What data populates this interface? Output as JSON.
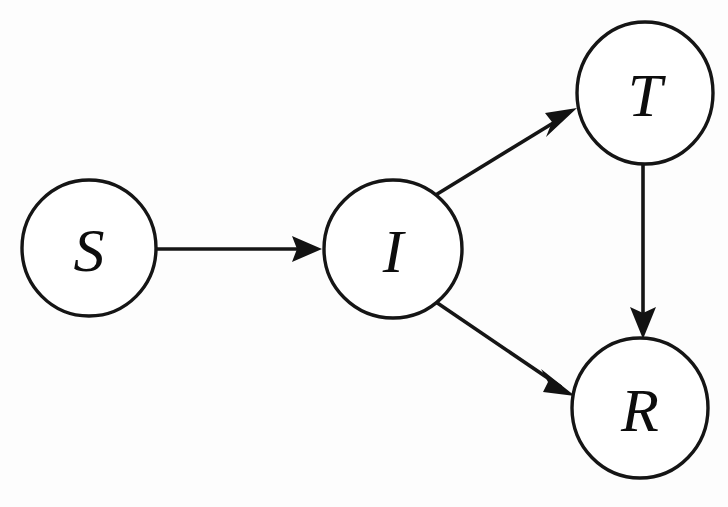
{
  "figure": {
    "type": "directed-graph",
    "background_color": "#fdfdfd",
    "stroke_color": "#151515",
    "label_color": "#0d0d0d",
    "width": 728,
    "height": 507,
    "caption_partial": ""
  },
  "nodes": [
    {
      "id": "S",
      "label": "S",
      "cx": 89,
      "cy": 248,
      "rx": 67,
      "ry": 68
    },
    {
      "id": "I",
      "label": "I",
      "cx": 393,
      "cy": 249,
      "rx": 69,
      "ry": 69
    },
    {
      "id": "T",
      "label": "T",
      "cx": 645,
      "cy": 93,
      "rx": 68,
      "ry": 71
    },
    {
      "id": "R",
      "label": "R",
      "cx": 640,
      "cy": 408,
      "rx": 68,
      "ry": 70
    }
  ],
  "edges": [
    {
      "id": "S-I",
      "from": "S",
      "to": "I",
      "label": "",
      "x1": 157,
      "y1": 249,
      "x2": 322,
      "y2": 249,
      "arrowhead": "filled-triangle"
    },
    {
      "id": "I-T",
      "from": "I",
      "to": "T",
      "label": "",
      "x1": 434,
      "y1": 196,
      "x2": 577,
      "y2": 108,
      "arrowhead": "filled-triangle"
    },
    {
      "id": "I-R",
      "from": "I",
      "to": "R",
      "label": "",
      "x1": 433,
      "y1": 300,
      "x2": 575,
      "y2": 396,
      "arrowhead": "filled-triangle"
    },
    {
      "id": "T-R",
      "from": "T",
      "to": "R",
      "label": "",
      "x1": 643,
      "y1": 164,
      "x2": 643,
      "y2": 337,
      "arrowhead": "filled-triangle"
    }
  ]
}
